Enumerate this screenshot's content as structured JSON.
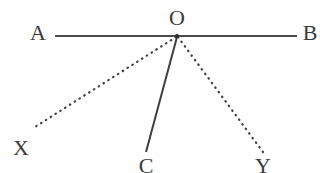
{
  "figure": {
    "width": 332,
    "height": 173,
    "background_color": "#fefefe",
    "stroke_color": "#4a4a4a",
    "label_color": "#3a3a3a",
    "label_font_size": 22
  },
  "points": {
    "A": {
      "label": "A",
      "x": 38,
      "y": 33
    },
    "B": {
      "label": "B",
      "x": 310,
      "y": 33
    },
    "O": {
      "label": "O",
      "x": 177,
      "y": 18
    },
    "X": {
      "label": "X",
      "x": 21,
      "y": 148
    },
    "C": {
      "label": "C",
      "x": 146,
      "y": 166
    },
    "Y": {
      "label": "Y",
      "x": 263,
      "y": 166
    }
  },
  "vertex": {
    "name": "O",
    "x": 177,
    "y": 36,
    "dot_radius": 2
  },
  "segments": [
    {
      "name": "line-AB",
      "from": "A",
      "to": "B",
      "style": "solid",
      "x1": 55,
      "y1": 36,
      "x2": 297,
      "y2": 36,
      "stroke_width": 2.2,
      "color": "#4a4a4a"
    },
    {
      "name": "ray-OX",
      "from": "O",
      "to": "X",
      "style": "dotted",
      "x1": 176,
      "y1": 37,
      "x2": 35,
      "y2": 127,
      "stroke_width": 2.2,
      "color": "#3f3f3f"
    },
    {
      "name": "ray-OC",
      "from": "O",
      "to": "C",
      "style": "solid",
      "x1": 177,
      "y1": 37,
      "x2": 146,
      "y2": 152,
      "stroke_width": 2.0,
      "color": "#3f3f3f"
    },
    {
      "name": "ray-OY",
      "from": "O",
      "to": "Y",
      "style": "dotted",
      "x1": 178,
      "y1": 37,
      "x2": 263,
      "y2": 152,
      "stroke_width": 2.2,
      "color": "#3f3f3f"
    }
  ]
}
